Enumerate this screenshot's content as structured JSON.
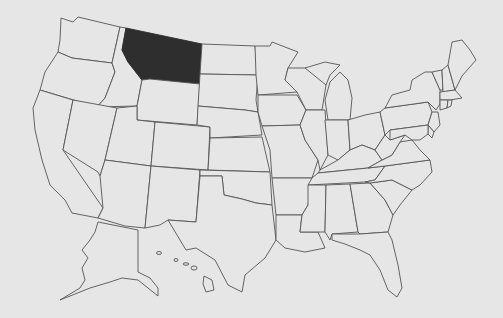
{
  "map": {
    "subject": "United States",
    "highlighted_state": "Montana",
    "colors": {
      "background": "#e6e6e6",
      "state_fill": "#e6e6e6",
      "state_stroke": "#555555",
      "highlight_fill": "#2e2e2e"
    },
    "states": [
      {
        "id": "WA",
        "name": "Washington"
      },
      {
        "id": "OR",
        "name": "Oregon"
      },
      {
        "id": "CA",
        "name": "California"
      },
      {
        "id": "ID",
        "name": "Idaho"
      },
      {
        "id": "NV",
        "name": "Nevada"
      },
      {
        "id": "MT",
        "name": "Montana",
        "highlighted": true
      },
      {
        "id": "WY",
        "name": "Wyoming"
      },
      {
        "id": "UT",
        "name": "Utah"
      },
      {
        "id": "AZ",
        "name": "Arizona"
      },
      {
        "id": "CO",
        "name": "Colorado"
      },
      {
        "id": "NM",
        "name": "New Mexico"
      },
      {
        "id": "ND",
        "name": "North Dakota"
      },
      {
        "id": "SD",
        "name": "South Dakota"
      },
      {
        "id": "NE",
        "name": "Nebraska"
      },
      {
        "id": "KS",
        "name": "Kansas"
      },
      {
        "id": "OK",
        "name": "Oklahoma"
      },
      {
        "id": "TX",
        "name": "Texas"
      },
      {
        "id": "MN",
        "name": "Minnesota"
      },
      {
        "id": "IA",
        "name": "Iowa"
      },
      {
        "id": "MO",
        "name": "Missouri"
      },
      {
        "id": "AR",
        "name": "Arkansas"
      },
      {
        "id": "LA",
        "name": "Louisiana"
      },
      {
        "id": "WI",
        "name": "Wisconsin"
      },
      {
        "id": "IL",
        "name": "Illinois"
      },
      {
        "id": "MI",
        "name": "Michigan"
      },
      {
        "id": "IN",
        "name": "Indiana"
      },
      {
        "id": "OH",
        "name": "Ohio"
      },
      {
        "id": "KY",
        "name": "Kentucky"
      },
      {
        "id": "TN",
        "name": "Tennessee"
      },
      {
        "id": "MS",
        "name": "Mississippi"
      },
      {
        "id": "AL",
        "name": "Alabama"
      },
      {
        "id": "GA",
        "name": "Georgia"
      },
      {
        "id": "FL",
        "name": "Florida"
      },
      {
        "id": "SC",
        "name": "South Carolina"
      },
      {
        "id": "NC",
        "name": "North Carolina"
      },
      {
        "id": "VA",
        "name": "Virginia"
      },
      {
        "id": "WV",
        "name": "West Virginia"
      },
      {
        "id": "PA",
        "name": "Pennsylvania"
      },
      {
        "id": "NY",
        "name": "New York"
      },
      {
        "id": "VT",
        "name": "Vermont"
      },
      {
        "id": "NH",
        "name": "New Hampshire"
      },
      {
        "id": "ME",
        "name": "Maine"
      },
      {
        "id": "MA",
        "name": "Massachusetts"
      },
      {
        "id": "CT",
        "name": "Connecticut"
      },
      {
        "id": "RI",
        "name": "Rhode Island"
      },
      {
        "id": "NJ",
        "name": "New Jersey"
      },
      {
        "id": "DE",
        "name": "Delaware"
      },
      {
        "id": "MD",
        "name": "Maryland"
      },
      {
        "id": "AK",
        "name": "Alaska"
      },
      {
        "id": "HI",
        "name": "Hawaii"
      }
    ]
  }
}
